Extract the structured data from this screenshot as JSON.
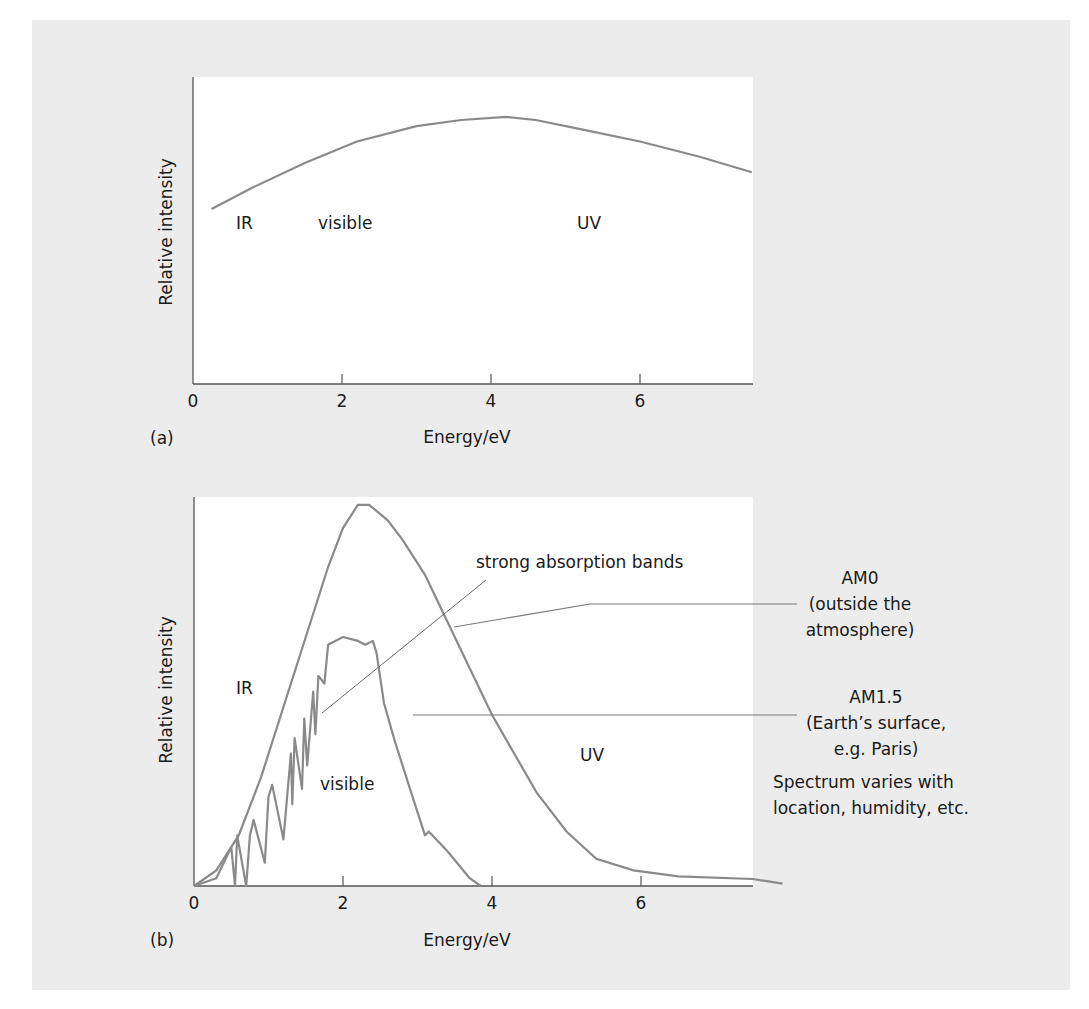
{
  "figure": {
    "background": "#ececec",
    "plot_bg": "#ffffff",
    "curve_color": "#8a8a8a",
    "axis_color": "#555555"
  },
  "chart_data": [
    {
      "id": "a",
      "panel_label": "(a)",
      "type": "line",
      "title": "",
      "xlabel": "Energy/eV",
      "ylabel": "Relative intensity",
      "xlim": [
        0,
        7.5
      ],
      "ylim": [
        0,
        1
      ],
      "xticks": [
        0,
        2,
        4,
        6
      ],
      "xtick_labels": [
        "0",
        "2",
        "4",
        "6"
      ],
      "grid": false,
      "annotations": [
        {
          "text": "IR",
          "x": 0.6,
          "y": 0.54
        },
        {
          "text": "visible",
          "x": 1.6,
          "y": 0.54
        },
        {
          "text": "UV",
          "x": 5.3,
          "y": 0.54
        }
      ],
      "series": [
        {
          "name": "spectrum",
          "x": [
            0.25,
            0.8,
            1.5,
            2.2,
            3.0,
            3.6,
            4.2,
            4.6,
            5.2,
            6.0,
            6.8,
            7.5
          ],
          "y": [
            0.57,
            0.64,
            0.72,
            0.79,
            0.84,
            0.86,
            0.87,
            0.86,
            0.83,
            0.79,
            0.74,
            0.69
          ]
        }
      ]
    },
    {
      "id": "b",
      "panel_label": "(b)",
      "type": "line",
      "title": "",
      "xlabel": "Energy/eV",
      "ylabel": "Relative intensity",
      "xlim": [
        0,
        7.5
      ],
      "ylim": [
        0,
        1
      ],
      "xticks": [
        0,
        2,
        4,
        6
      ],
      "xtick_labels": [
        "0",
        "2",
        "4",
        "6"
      ],
      "grid": false,
      "annotations": [
        {
          "text": "IR",
          "x": 0.6,
          "y": 0.6
        },
        {
          "text": "visible",
          "x": 1.75,
          "y": 0.27
        },
        {
          "text": "UV",
          "x": 5.2,
          "y": 0.34
        },
        {
          "text": "strong absorption bands",
          "x": 3.15,
          "y": 0.86
        }
      ],
      "series": [
        {
          "name": "AM0",
          "label_lines": [
            "AM0",
            "(outside the",
            "atmosphere)"
          ],
          "x": [
            0,
            0.3,
            0.6,
            0.9,
            1.2,
            1.5,
            1.8,
            2.0,
            2.2,
            2.35,
            2.6,
            2.8,
            3.1,
            3.4,
            3.7,
            4.0,
            4.3,
            4.6,
            5.0,
            5.4,
            5.9,
            6.5,
            7.5,
            7.9
          ],
          "y": [
            0.0,
            0.04,
            0.13,
            0.28,
            0.46,
            0.64,
            0.82,
            0.92,
            0.98,
            0.98,
            0.94,
            0.89,
            0.8,
            0.68,
            0.56,
            0.44,
            0.34,
            0.24,
            0.14,
            0.07,
            0.04,
            0.025,
            0.018,
            0.006
          ]
        },
        {
          "name": "AM1.5",
          "label_lines": [
            "AM1.5",
            "(Earth’s surface,",
            "e.g. Paris)"
          ],
          "x": [
            0,
            0.3,
            0.5,
            0.55,
            0.58,
            0.7,
            0.75,
            0.8,
            0.95,
            1.0,
            1.05,
            1.2,
            1.3,
            1.32,
            1.35,
            1.45,
            1.48,
            1.52,
            1.6,
            1.63,
            1.67,
            1.75,
            1.8,
            2.0,
            2.2,
            2.3,
            2.4,
            2.45,
            2.55,
            2.7,
            2.9,
            3.1,
            3.15,
            3.4,
            3.7,
            3.85
          ],
          "y": [
            0.0,
            0.02,
            0.1,
            0.0,
            0.13,
            0.0,
            0.13,
            0.17,
            0.06,
            0.23,
            0.26,
            0.12,
            0.34,
            0.21,
            0.38,
            0.25,
            0.43,
            0.31,
            0.5,
            0.39,
            0.54,
            0.52,
            0.62,
            0.64,
            0.63,
            0.62,
            0.63,
            0.6,
            0.47,
            0.37,
            0.25,
            0.13,
            0.14,
            0.09,
            0.02,
            0.0
          ]
        }
      ],
      "notes": [
        "Spectrum varies with",
        "location, humidity, etc."
      ]
    }
  ]
}
